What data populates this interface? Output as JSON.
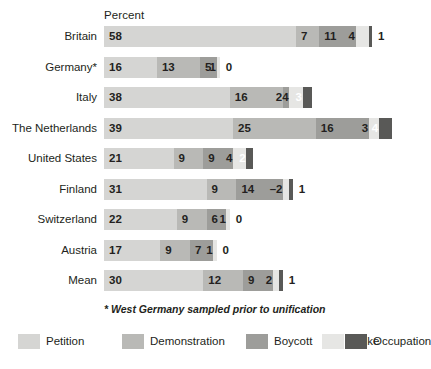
{
  "axis": {
    "title": "Percent"
  },
  "footnote": "* West Germany sampled prior to unification",
  "legend": [
    {
      "label": "Petition",
      "color": "#d5d5d3"
    },
    {
      "label": "Demonstration",
      "color": "#b9b9b6"
    },
    {
      "label": "Boycott",
      "color": "#9d9d9a"
    },
    {
      "label": "Strike",
      "color": "#e6e6e4"
    },
    {
      "label": "Occupation",
      "color": "#595957"
    }
  ],
  "rows": [
    {
      "label": "Britain",
      "cells": [
        {
          "value": "58",
          "inside": true
        },
        {
          "value": "7",
          "inside": true
        },
        {
          "value": "11",
          "inside": true
        },
        {
          "value": "4",
          "inside": true
        },
        {
          "value": "1",
          "inside": false
        }
      ]
    },
    {
      "label": "Germany*",
      "cells": [
        {
          "value": "16",
          "inside": true
        },
        {
          "value": "13",
          "inside": true
        },
        {
          "value": "5",
          "inside": true
        },
        {
          "value": "1",
          "inside": true
        },
        {
          "value": "0",
          "inside": false
        }
      ]
    },
    {
      "label": "Italy",
      "cells": [
        {
          "value": "38",
          "inside": true
        },
        {
          "value": "16",
          "inside": true
        },
        {
          "value": "2",
          "inside": true
        },
        {
          "value": "4",
          "inside": true
        },
        {
          "value": "3",
          "inside": true
        }
      ]
    },
    {
      "label": "The Netherlands",
      "cells": [
        {
          "value": "39",
          "inside": true
        },
        {
          "value": "25",
          "inside": true
        },
        {
          "value": "16",
          "inside": true
        },
        {
          "value": "3",
          "inside": true
        },
        {
          "value": "4",
          "inside": true
        }
      ]
    },
    {
      "label": "United States",
      "cells": [
        {
          "value": "21",
          "inside": true
        },
        {
          "value": "9",
          "inside": true
        },
        {
          "value": "9",
          "inside": true
        },
        {
          "value": "4",
          "inside": true
        },
        {
          "value": "2",
          "inside": true
        }
      ]
    },
    {
      "label": "Finland",
      "cells": [
        {
          "value": "31",
          "inside": true
        },
        {
          "value": "9",
          "inside": true
        },
        {
          "value": "14",
          "inside": true
        },
        {
          "value": "–2",
          "inside": true
        },
        {
          "value": "1",
          "inside": false
        }
      ]
    },
    {
      "label": "Switzerland",
      "cells": [
        {
          "value": "22",
          "inside": true
        },
        {
          "value": "9",
          "inside": true
        },
        {
          "value": "6",
          "inside": true
        },
        {
          "value": "1",
          "inside": true
        },
        {
          "value": "0",
          "inside": false
        }
      ]
    },
    {
      "label": "Austria",
      "cells": [
        {
          "value": "17",
          "inside": true
        },
        {
          "value": "9",
          "inside": true
        },
        {
          "value": "7",
          "inside": true
        },
        {
          "value": "1",
          "inside": true
        },
        {
          "value": "0",
          "inside": false
        }
      ]
    },
    {
      "label": "Mean",
      "cells": [
        {
          "value": "30",
          "inside": true
        },
        {
          "value": "12",
          "inside": true
        },
        {
          "value": "9",
          "inside": true
        },
        {
          "value": "2",
          "inside": true
        },
        {
          "value": "1",
          "inside": false
        }
      ]
    }
  ],
  "chart_data": {
    "type": "bar",
    "title": "",
    "subtitle": "",
    "orientation": "horizontal",
    "stacked": true,
    "xlabel": "Percent",
    "ylabel": "",
    "grid": false,
    "legend_position": "bottom",
    "categories": [
      "Britain",
      "Germany*",
      "Italy",
      "The Netherlands",
      "United States",
      "Finland",
      "Switzerland",
      "Austria",
      "Mean"
    ],
    "series": [
      {
        "name": "Petition",
        "color": "#d5d5d3",
        "values": [
          58,
          16,
          38,
          39,
          21,
          31,
          22,
          17,
          30
        ]
      },
      {
        "name": "Demonstration",
        "color": "#b9b9b6",
        "values": [
          7,
          13,
          16,
          25,
          9,
          9,
          9,
          9,
          12
        ]
      },
      {
        "name": "Boycott",
        "color": "#9d9d9a",
        "values": [
          11,
          5,
          2,
          16,
          9,
          14,
          6,
          7,
          9
        ]
      },
      {
        "name": "Strike",
        "color": "#e6e6e4",
        "values": [
          4,
          1,
          4,
          3,
          4,
          2,
          1,
          1,
          2
        ]
      },
      {
        "name": "Occupation",
        "color": "#595957",
        "values": [
          1,
          0,
          3,
          4,
          2,
          1,
          0,
          0,
          1
        ]
      }
    ],
    "totals": [
      81,
      35,
      63,
      87,
      45,
      57,
      38,
      34,
      54
    ],
    "annotations": [
      {
        "category": "Finland",
        "series": "Strike",
        "text": "–2",
        "note": "leader dash precedes the value because the segment is too narrow for an inside label"
      },
      {
        "text": "* West Germany sampled prior to unification",
        "role": "footnote"
      }
    ]
  }
}
